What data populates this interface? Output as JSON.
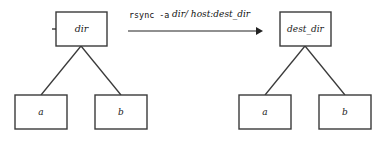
{
  "diagram": {
    "command": {
      "full_text": "rsync -a dir/ host:dest_dir",
      "program_part": "rsync -a",
      "argument_part": "dir/ host:dest_dir",
      "source_arg": "dir/",
      "dest_arg": "host:dest_dir"
    },
    "arrow": {
      "direction": "left-to-right",
      "label": "rsync -a dir/ host:dest_dir"
    },
    "source_tree": {
      "name": "source-tree",
      "root": {
        "label": "dir"
      },
      "children": [
        {
          "label": "a"
        },
        {
          "label": "b"
        }
      ]
    },
    "dest_tree": {
      "name": "destination-tree",
      "root": {
        "label": "dest_dir"
      },
      "children": [
        {
          "label": "a"
        },
        {
          "label": "b"
        }
      ]
    },
    "colors": {
      "background": "#ffffff",
      "box_stroke": "#3a3a3a",
      "box_fill": "#ffffff",
      "text": "#1a1a1a",
      "arrow": "#222222"
    }
  }
}
